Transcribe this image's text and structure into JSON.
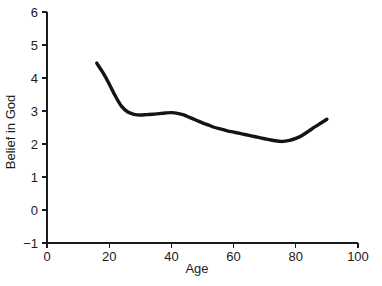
{
  "chart_data": {
    "type": "line",
    "title": "",
    "xlabel": "Age",
    "ylabel": "Belief in God",
    "xlim": [
      0,
      100
    ],
    "ylim": [
      -1,
      6
    ],
    "grid": false,
    "legend": null,
    "xticks": [
      0,
      20,
      40,
      60,
      80,
      100
    ],
    "xtick_labels": [
      "0",
      "20",
      "40",
      "60",
      "80",
      "100"
    ],
    "yticks": [
      -1,
      0,
      1,
      2,
      3,
      4,
      5,
      6
    ],
    "ytick_labels": [
      "−1",
      "0",
      "1",
      "2",
      "3",
      "4",
      "5",
      "6"
    ],
    "series": [
      {
        "name": "Belief in God by Age",
        "color": "#141414",
        "x": [
          16,
          18,
          20,
          22,
          24,
          26,
          28,
          30,
          32,
          34,
          36,
          38,
          40,
          42,
          44,
          46,
          48,
          50,
          52,
          54,
          56,
          58,
          60,
          62,
          64,
          66,
          68,
          70,
          72,
          74,
          75,
          76,
          78,
          80,
          82,
          84,
          86,
          88,
          90
        ],
        "y": [
          4.45,
          4.16,
          3.82,
          3.45,
          3.14,
          2.97,
          2.9,
          2.88,
          2.89,
          2.9,
          2.92,
          2.94,
          2.95,
          2.93,
          2.88,
          2.8,
          2.72,
          2.64,
          2.57,
          2.5,
          2.45,
          2.4,
          2.36,
          2.32,
          2.28,
          2.24,
          2.2,
          2.16,
          2.12,
          2.09,
          2.08,
          2.08,
          2.11,
          2.17,
          2.26,
          2.38,
          2.51,
          2.63,
          2.75
        ]
      }
    ]
  },
  "axis_titles": {
    "x": "Age",
    "y": "Belief in God"
  }
}
